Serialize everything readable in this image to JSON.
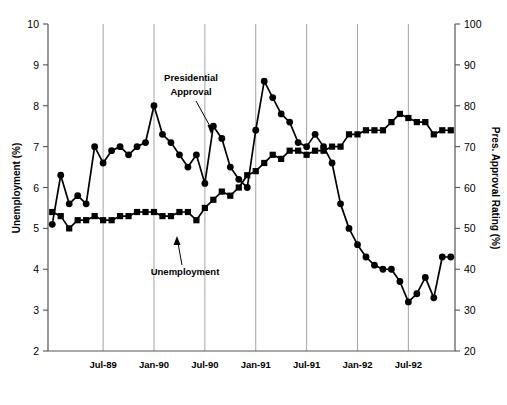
{
  "chart_data": {
    "type": "line",
    "title": "",
    "xlabel": "",
    "ylabel": "Unemployment (%)",
    "y2label": "Pres. Approval Rating (%)",
    "grid": "vertical-only",
    "legend_position": "inline-annotations",
    "x_tick_labels": [
      "Jul-89",
      "Jan-90",
      "Jul-90",
      "Jan-91",
      "Jul-91",
      "Jan-92",
      "Jul-92"
    ],
    "y_tick_labels": [
      "2",
      "3",
      "4",
      "5",
      "6",
      "7",
      "8",
      "9",
      "10"
    ],
    "y2_tick_labels": [
      "20",
      "30",
      "40",
      "50",
      "60",
      "70",
      "80",
      "90",
      "100"
    ],
    "ylim": [
      2,
      10
    ],
    "y2lim": [
      20,
      100
    ],
    "x_range": [
      "Jan-89",
      "Dec-92"
    ],
    "annotations": [
      {
        "label": "Presidential Approval",
        "line1": "Presidential",
        "line2": "Approval"
      },
      {
        "label": "Unemployment",
        "line1": "Unemployment"
      }
    ],
    "series": [
      {
        "name": "Unemployment",
        "marker": "square",
        "axis": "left",
        "units": "percent",
        "x": [
          "Jan-89",
          "Feb-89",
          "Mar-89",
          "Apr-89",
          "May-89",
          "Jun-89",
          "Jul-89",
          "Aug-89",
          "Sep-89",
          "Oct-89",
          "Nov-89",
          "Dec-89",
          "Jan-90",
          "Feb-90",
          "Mar-90",
          "Apr-90",
          "May-90",
          "Jun-90",
          "Jul-90",
          "Aug-90",
          "Sep-90",
          "Oct-90",
          "Nov-90",
          "Dec-90",
          "Jan-91",
          "Feb-91",
          "Mar-91",
          "Apr-91",
          "May-91",
          "Jun-91",
          "Jul-91",
          "Aug-91",
          "Sep-91",
          "Oct-91",
          "Nov-91",
          "Dec-91",
          "Jan-92",
          "Feb-92",
          "Mar-92",
          "Apr-92",
          "May-92",
          "Jun-92",
          "Jul-92",
          "Aug-92",
          "Sep-92",
          "Oct-92",
          "Nov-92",
          "Dec-92"
        ],
        "values": [
          5.4,
          5.3,
          5.0,
          5.2,
          5.2,
          5.3,
          5.2,
          5.2,
          5.3,
          5.3,
          5.4,
          5.4,
          5.4,
          5.3,
          5.3,
          5.4,
          5.4,
          5.2,
          5.5,
          5.7,
          5.9,
          5.8,
          6.0,
          6.3,
          6.4,
          6.6,
          6.8,
          6.7,
          6.9,
          6.9,
          6.8,
          6.9,
          6.9,
          7.0,
          7.0,
          7.3,
          7.3,
          7.4,
          7.4,
          7.4,
          7.6,
          7.8,
          7.7,
          7.6,
          7.6,
          7.3,
          7.4,
          7.4
        ]
      },
      {
        "name": "Presidential Approval",
        "marker": "circle",
        "axis": "right",
        "units": "percent",
        "x": [
          "Jan-89",
          "Feb-89",
          "Mar-89",
          "Apr-89",
          "May-89",
          "Jun-89",
          "Jul-89",
          "Aug-89",
          "Sep-89",
          "Oct-89",
          "Nov-89",
          "Dec-89",
          "Jan-90",
          "Feb-90",
          "Mar-90",
          "Apr-90",
          "May-90",
          "Jun-90",
          "Jul-90",
          "Aug-90",
          "Sep-90",
          "Oct-90",
          "Nov-90",
          "Dec-90",
          "Jan-91",
          "Feb-91",
          "Mar-91",
          "Apr-91",
          "May-91",
          "Jun-91",
          "Jul-91",
          "Aug-91",
          "Sep-91",
          "Oct-91",
          "Nov-91",
          "Dec-91",
          "Jan-92",
          "Feb-92",
          "Mar-92",
          "Apr-92",
          "May-92",
          "Jun-92",
          "Jul-92",
          "Aug-92",
          "Sep-92",
          "Oct-92",
          "Nov-92",
          "Dec-92"
        ],
        "values_right_axis": [
          51,
          63,
          56,
          58,
          56,
          70,
          66,
          69,
          70,
          68,
          70,
          71,
          80,
          73,
          71,
          68,
          65,
          68,
          61,
          75,
          72,
          65,
          62,
          60,
          74,
          86,
          82,
          78,
          76,
          71,
          70,
          73,
          70,
          66,
          56,
          50,
          46,
          43,
          41,
          40,
          40,
          37,
          32,
          34,
          38,
          33,
          43,
          43
        ]
      }
    ]
  },
  "axes": {
    "left_title": "Unemployment (%)",
    "right_title": "Pres. Approval Rating (%)"
  }
}
